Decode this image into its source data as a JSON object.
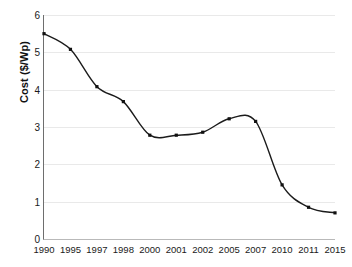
{
  "chart_data": {
    "type": "line",
    "title": "",
    "xlabel": "",
    "ylabel": "Cost ($/Wp)",
    "categories": [
      "1990",
      "1995",
      "1997",
      "1998",
      "2000",
      "2001",
      "2002",
      "2005",
      "2007",
      "2010",
      "2011",
      "2015"
    ],
    "values": [
      5.5,
      5.08,
      4.08,
      3.68,
      2.78,
      2.78,
      2.86,
      3.22,
      3.15,
      1.45,
      0.85,
      0.7
    ],
    "series": [
      {
        "name": "Cost ($/Wp)",
        "values": [
          5.5,
          5.08,
          4.08,
          3.68,
          2.78,
          2.78,
          2.86,
          3.22,
          3.15,
          1.45,
          0.85,
          0.7
        ]
      }
    ],
    "ylim": [
      0,
      6
    ],
    "ytick_labels": [
      "0",
      "1",
      "2",
      "3",
      "4",
      "5",
      "6"
    ],
    "ytick_values": [
      0,
      1,
      2,
      3,
      4,
      5,
      6
    ],
    "grid": true,
    "legend": false,
    "legend_position": "none",
    "marker": "square",
    "line_color": "#1b1b1b",
    "marker_color": "#111111",
    "grid_color": "#e9e9e9",
    "axis_color": "#6e6e6e",
    "background_color": "#ffffff",
    "smoothing": "spline",
    "annotations": []
  }
}
